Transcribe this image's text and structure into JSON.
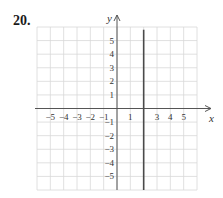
{
  "problem": {
    "number": "20."
  },
  "chart_data": {
    "type": "line",
    "title": "",
    "xlabel": "x",
    "ylabel": "y",
    "xlim": [
      -6,
      6
    ],
    "ylim": [
      -6,
      6
    ],
    "grid": true,
    "x_ticks": [
      "-5",
      "-4",
      "-3",
      "-2",
      "-1",
      "1",
      "3",
      "4",
      "5"
    ],
    "y_ticks": [
      "5",
      "4",
      "3",
      "2",
      "1",
      "-1",
      "-2",
      "-3",
      "-4",
      "-5"
    ],
    "series": [
      {
        "name": "x = 2",
        "x": [
          2,
          2
        ],
        "y": [
          -6,
          5.8
        ],
        "color": "#4a4a4a"
      }
    ]
  },
  "colors": {
    "grid": "#d8d8d8",
    "axis": "#555555",
    "line": "#4a4a4a",
    "text": "#333333"
  }
}
